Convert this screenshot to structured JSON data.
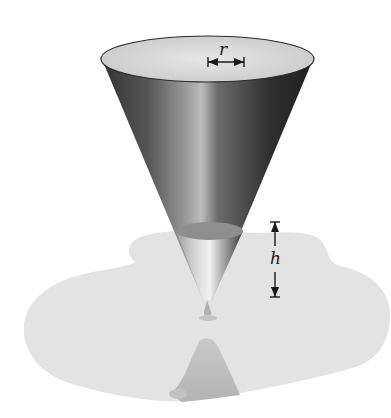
{
  "figure": {
    "labels": {
      "radius": "r",
      "height": "h"
    },
    "colors": {
      "background": "#ffffff",
      "cone_dark": "#3a3a3a",
      "cone_mid": "#6e6e6e",
      "cone_highlight": "#c8c8c8",
      "rim_interior": "#dcdcdc",
      "water_surface": "#8c8c8c",
      "water_body": "#d6d6d6",
      "puddle": "#e2e2e2",
      "reflection": "#bdbdbd",
      "dimension_line": "#1a1a1a"
    }
  }
}
